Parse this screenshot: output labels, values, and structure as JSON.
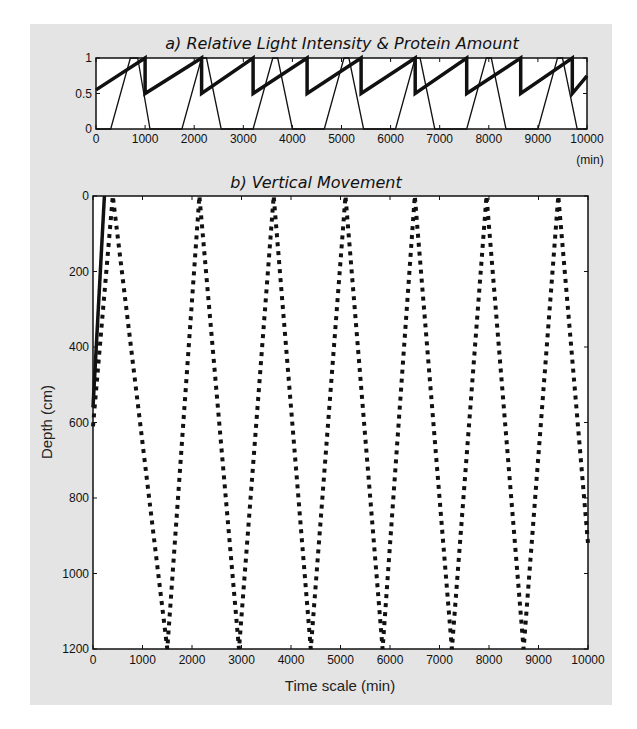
{
  "chart_data": [
    {
      "id": "a",
      "type": "line",
      "title": "a)  Relative Light Intensity &  Protein Amount",
      "xlabel": "(min)",
      "ylabel": "",
      "xlim": [
        0,
        10000
      ],
      "ylim": [
        0,
        1
      ],
      "x_ticks": [
        "0",
        "1000",
        "2000",
        "3000",
        "4000",
        "5000",
        "6000",
        "7000",
        "8000",
        "9000",
        "10000"
      ],
      "y_ticks": [
        "0",
        "0.5",
        "1"
      ],
      "grid": false,
      "legend": null,
      "series": [
        {
          "name": "Relative Light Intensity",
          "style": "thin solid",
          "x": [
            0,
            300,
            700,
            850,
            1100,
            1750,
            2150,
            2250,
            2550,
            3200,
            3600,
            3700,
            4000,
            4650,
            5050,
            5150,
            5450,
            6100,
            6500,
            6600,
            6900,
            7550,
            7950,
            8050,
            8350,
            9000,
            9400,
            9500,
            9800,
            10000
          ],
          "y": [
            0,
            0,
            1,
            1,
            0,
            0,
            1,
            1,
            0,
            0,
            1,
            1,
            0,
            0,
            1,
            1,
            0,
            0,
            1,
            1,
            0,
            0,
            1,
            1,
            0,
            0,
            1,
            1,
            0,
            0
          ]
        },
        {
          "name": "Protein Amount",
          "style": "thick solid sawtooth",
          "x": [
            0,
            1000,
            1000,
            2150,
            2150,
            3200,
            3200,
            4300,
            4300,
            5400,
            5400,
            6500,
            6500,
            7550,
            7550,
            8650,
            8650,
            9700,
            9700,
            10000
          ],
          "y": [
            0.55,
            1.0,
            0.5,
            1.0,
            0.5,
            1.0,
            0.5,
            1.0,
            0.5,
            1.0,
            0.5,
            1.0,
            0.5,
            1.0,
            0.5,
            1.0,
            0.5,
            1.0,
            0.5,
            0.75
          ]
        }
      ]
    },
    {
      "id": "b",
      "type": "line",
      "title": "b)  Vertical Movement",
      "xlabel": "Time scale (min)",
      "ylabel": "Depth (cm)",
      "xlim": [
        0,
        10000
      ],
      "ylim": [
        1200,
        0
      ],
      "y_inverted": true,
      "x_ticks": [
        "0",
        "1000",
        "2000",
        "3000",
        "4000",
        "5000",
        "6000",
        "7000",
        "8000",
        "9000",
        "10000"
      ],
      "y_ticks": [
        "0",
        "200",
        "400",
        "600",
        "800",
        "1000",
        "1200"
      ],
      "grid": false,
      "legend": null,
      "series": [
        {
          "name": "Depth (dotted)",
          "style": "dotted",
          "x": [
            0,
            400,
            1500,
            2150,
            2950,
            3650,
            4400,
            5100,
            5850,
            6500,
            7250,
            7950,
            8700,
            9400,
            10000
          ],
          "y": [
            610,
            0,
            1200,
            0,
            1200,
            0,
            1200,
            0,
            1200,
            0,
            1200,
            0,
            1200,
            0,
            920
          ]
        },
        {
          "name": "Depth (solid)",
          "style": "thick solid",
          "x": [
            0,
            230
          ],
          "y": [
            560,
            0
          ]
        }
      ]
    }
  ]
}
